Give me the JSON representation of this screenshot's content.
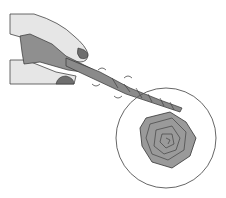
{
  "illustration": {
    "subject": "Hand twisting a paper stem into a rose",
    "colors": {
      "skin": "#e6e6e6",
      "paper": "#8f8f8f",
      "rose": "#9a9a9a",
      "outline": "#333333",
      "circle": "#555555",
      "nail": "#6e6e6e"
    }
  }
}
